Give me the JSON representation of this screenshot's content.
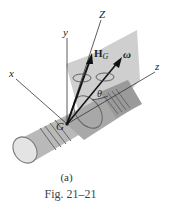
{
  "figure": {
    "axis_labels": {
      "Z": "Z",
      "y": "y",
      "x": "x",
      "z": "z"
    },
    "vector_labels": {
      "angular_momentum": "H",
      "angular_momentum_sub": "G",
      "angular_velocity": "ω"
    },
    "point_label": "G",
    "angle_label": "θ",
    "sublabel": "(a)",
    "caption": "Fig. 21–21"
  },
  "colors": {
    "plane": "#c9c9c9",
    "body": "#bdbdbd",
    "line": "#333333"
  }
}
